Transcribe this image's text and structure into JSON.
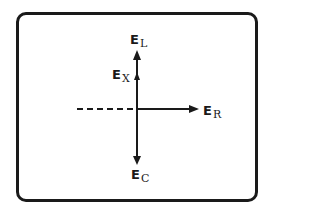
{
  "diagram": {
    "type": "phasor-diagram",
    "colors": {
      "stroke": "#1a1a1a",
      "background": "#ffffff"
    },
    "vectors": [
      {
        "id": "EL",
        "label_main": "E",
        "label_sub": "L",
        "direction": "up",
        "length": "long"
      },
      {
        "id": "EX",
        "label_main": "E",
        "label_sub": "X",
        "direction": "up",
        "length": "short"
      },
      {
        "id": "ER",
        "label_main": "E",
        "label_sub": "R",
        "direction": "right",
        "length": "long"
      },
      {
        "id": "EC",
        "label_main": "E",
        "label_sub": "C",
        "direction": "down",
        "length": "long"
      }
    ],
    "reference_line": {
      "style": "dashed",
      "direction": "left"
    }
  }
}
